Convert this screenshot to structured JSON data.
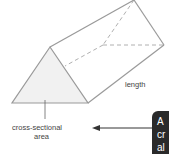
{
  "diagram": {
    "labels": {
      "length": "length",
      "cross_section_line1": "cross-sectional",
      "cross_section_line2": "area"
    },
    "callout": {
      "line1": "A",
      "line2": "cr",
      "line3": "al"
    },
    "colors": {
      "edge": "#9a9a9a",
      "face_fill": "#f1f1f1",
      "callout_bg": "#2a2a2a",
      "arrow": "#333333"
    }
  }
}
